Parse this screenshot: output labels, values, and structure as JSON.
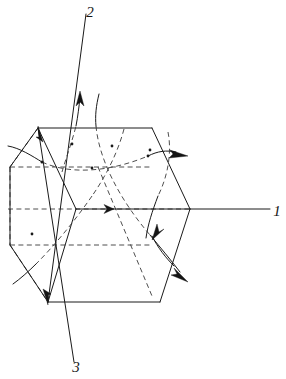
{
  "figure": {
    "background_color": "#ffffff",
    "line_color": "#1a1a1a",
    "hidden_line_color": "#3a3a3a",
    "width": 286,
    "height": 379,
    "axes": [
      {
        "id": "axis-1",
        "label": "1",
        "label_x": 277,
        "label_y": 216,
        "description": "horizontal axis to the right",
        "style": "solid-outside-dashed-inside"
      },
      {
        "id": "axis-2",
        "label": "2",
        "label_x": 90,
        "label_y": 17,
        "description": "diagonal axis to the upper left",
        "style": "solid"
      },
      {
        "id": "axis-3",
        "label": "3",
        "label_x": 76,
        "label_y": 372,
        "description": "diagonal axis to the lower left",
        "style": "solid"
      }
    ],
    "box": {
      "name": "parallelepiped",
      "visible_edges": 9,
      "hidden_edges": 3
    },
    "flow_arrows": [
      {
        "id": "flow-axis1-top",
        "about_axis": "1",
        "direction": "right"
      },
      {
        "id": "flow-axis1-left",
        "about_axis": "1",
        "direction": "right"
      },
      {
        "id": "flow-axis2-up",
        "about_axis": "2",
        "direction": "up"
      },
      {
        "id": "flow-axis2-down",
        "about_axis": "2",
        "direction": "down"
      },
      {
        "id": "flow-axis3-arrow",
        "about_axis": "3",
        "direction": "down-right"
      },
      {
        "id": "flow-axis1-center",
        "about_axis": "1",
        "direction": "right"
      }
    ]
  }
}
